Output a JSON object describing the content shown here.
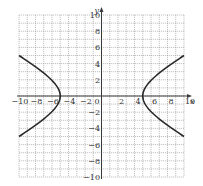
{
  "chart_data": {
    "type": "line",
    "title": "",
    "xlabel": "x",
    "ylabel": "y",
    "xlim": [
      -10,
      10
    ],
    "ylim": [
      -10,
      10
    ],
    "grid": true,
    "grid_step": 1,
    "x_ticks": [
      -10,
      -8,
      -6,
      -4,
      -2,
      0,
      2,
      4,
      6,
      8,
      10
    ],
    "x_tick_labels": [
      "−10",
      "−8",
      "−6",
      "−4",
      "−2",
      "0",
      "2",
      "4",
      "6",
      "8",
      "10"
    ],
    "y_ticks": [
      10,
      8,
      6,
      4,
      2,
      -2,
      -4,
      -6,
      -8,
      -10
    ],
    "y_tick_labels": [
      "10",
      "8",
      "6",
      "4",
      "2",
      "−2",
      "−4",
      "−6",
      "−8",
      "−10"
    ],
    "series": [
      {
        "name": "hyperbola x^2/25 - 3y^2/25 = 1 (left branch)",
        "equation": "x^2 - 3y^2 = 25",
        "x": [
          -10,
          -9.5,
          -9,
          -8.5,
          -8,
          -7.5,
          -7,
          -6.5,
          -6,
          -5.5,
          -5.2,
          -5,
          -5.2,
          -5.5,
          -6,
          -6.5,
          -7,
          -7.5,
          -8,
          -8.5,
          -9,
          -9.5,
          -10
        ],
        "y": [
          5,
          4.7,
          4.32,
          3.97,
          3.6,
          3.23,
          2.83,
          2.4,
          1.91,
          1.32,
          0.83,
          0,
          -0.83,
          -1.32,
          -1.91,
          -2.4,
          -2.83,
          -3.23,
          -3.6,
          -3.97,
          -4.32,
          -4.7,
          -5
        ]
      },
      {
        "name": "hyperbola x^2/25 - 3y^2/25 = 1 (right branch)",
        "equation": "x^2 - 3y^2 = 25",
        "x": [
          10,
          9.5,
          9,
          8.5,
          8,
          7.5,
          7,
          6.5,
          6,
          5.5,
          5.2,
          5,
          5.2,
          5.5,
          6,
          6.5,
          7,
          7.5,
          8,
          8.5,
          9,
          9.5,
          10
        ],
        "y": [
          5,
          4.7,
          4.32,
          3.97,
          3.6,
          3.23,
          2.83,
          2.4,
          1.91,
          1.32,
          0.83,
          0,
          -0.83,
          -1.32,
          -1.91,
          -2.4,
          -2.83,
          -3.23,
          -3.6,
          -3.97,
          -4.32,
          -4.7,
          -5
        ]
      }
    ],
    "legend": "none"
  }
}
